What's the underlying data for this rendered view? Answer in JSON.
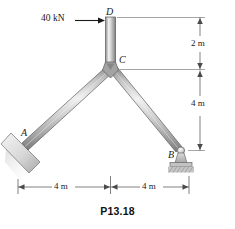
{
  "figure": {
    "caption": "P13.18",
    "background_color": "#ffffff"
  },
  "load": {
    "label": "40 kN",
    "arrow_icon": "right-arrow-icon",
    "applied_at": "D",
    "direction": "right"
  },
  "joints": [
    {
      "id": "D",
      "label": "D",
      "kind": "free-end-top"
    },
    {
      "id": "C",
      "label": "C",
      "kind": "rigid-junction"
    },
    {
      "id": "A",
      "label": "A",
      "kind": "fixed-plate-support"
    },
    {
      "id": "B",
      "label": "B",
      "kind": "pin-rocker-support"
    }
  ],
  "members": [
    {
      "id": "CD",
      "from": "C",
      "to": "D",
      "orientation": "vertical"
    },
    {
      "id": "AC",
      "from": "A",
      "to": "C",
      "orientation": "diagonal-left"
    },
    {
      "id": "CB",
      "from": "C",
      "to": "B",
      "orientation": "diagonal-right"
    }
  ],
  "dimensions": {
    "vertical": [
      {
        "id": "v-top",
        "label": "2 m",
        "value": 2,
        "unit": "m",
        "spans": "D to C"
      },
      {
        "id": "v-bottom",
        "label": "4 m",
        "value": 4,
        "unit": "m",
        "spans": "C to B"
      }
    ],
    "horizontal": [
      {
        "id": "h-left",
        "label": "4 m",
        "value": 4,
        "unit": "m",
        "spans": "A to C"
      },
      {
        "id": "h-right",
        "label": "4 m",
        "value": 4,
        "unit": "m",
        "spans": "C to B"
      }
    ]
  },
  "colors": {
    "member_edge": "#555555",
    "member_light": "#f2f2f2",
    "member_mid": "#bdbdbd",
    "member_dark": "#8f8f8f",
    "dimension_line": "#4a4a4a",
    "support_fill": "#cfcfcf",
    "text": "#1a1a1a"
  }
}
